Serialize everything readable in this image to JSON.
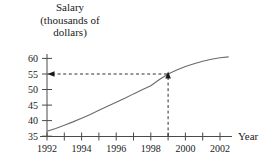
{
  "figure": {
    "background_color": "#ffffff",
    "ink_color": "#4a4a4a",
    "text_color": "#1a1a1a"
  },
  "title_lines": [
    "Salary",
    "(thousands of",
    "dollars)"
  ],
  "axis_label_x": "Year",
  "chart_data": {
    "type": "line",
    "title": "Salary (thousands of dollars)",
    "xlabel": "Year",
    "ylabel": "Salary (thousands of dollars)",
    "xlim": [
      1992,
      2003
    ],
    "ylim": [
      35,
      61
    ],
    "grid": false,
    "legend": "none",
    "x_tick_values": [
      1992,
      1993,
      1994,
      1995,
      1996,
      1997,
      1998,
      1999,
      2000,
      2001,
      2002
    ],
    "x_tick_labels": [
      "1992",
      "",
      "1994",
      "",
      "1996",
      "",
      "1998",
      "",
      "2000",
      "",
      "2002"
    ],
    "x_labeled_ticks": [
      "1992",
      "1994",
      "1996",
      "1998",
      "2000",
      "2002"
    ],
    "y_tick_values": [
      35,
      40,
      45,
      50,
      55,
      60
    ],
    "y_tick_labels": [
      "35",
      "40",
      "45",
      "50",
      "55",
      "60"
    ],
    "series": [
      {
        "name": "Salary",
        "x": [
          1992,
          1992.5,
          1993,
          1993.5,
          1994,
          1994.5,
          1995,
          1995.5,
          1996,
          1996.5,
          1997,
          1997.5,
          1998,
          1998.5,
          1999,
          1999.5,
          2000,
          2000.5,
          2001,
          2001.5,
          2002,
          2002.5
        ],
        "values": [
          36.6,
          37.5,
          38.5,
          39.6,
          40.8,
          42.0,
          43.3,
          44.6,
          45.9,
          47.2,
          48.6,
          49.9,
          51.2,
          53.2,
          55.0,
          56.3,
          57.4,
          58.3,
          59.1,
          59.7,
          60.2,
          60.5
        ]
      }
    ],
    "annotations": [
      {
        "name": "guide-point",
        "x": 1999,
        "y": 55,
        "vertical_guide": true,
        "horizontal_guide": true,
        "style": "dashed-with-arrowheads"
      }
    ]
  }
}
